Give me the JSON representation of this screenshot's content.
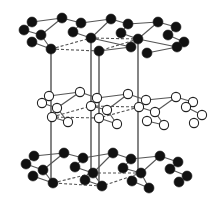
{
  "diagram": {
    "title": "",
    "type": "layered hexagonal crystal structure",
    "colors": {
      "filled_atom": "#111111",
      "open_atom": "#ffffff",
      "bond": "#555555",
      "outline": "#222222"
    },
    "unit_cell_verticals_x": [
      51,
      91,
      99,
      138
    ],
    "unit_cell_y_range": [
      49,
      186
    ],
    "layers": [
      {
        "name": "top",
        "fill": "filled",
        "rows": [
          [
            [
              32,
              22
            ],
            [
              62,
              18
            ],
            [
              81,
              23
            ],
            [
              111,
              19
            ],
            [
              128,
              24
            ],
            [
              158,
              22
            ],
            [
              176,
              27
            ]
          ],
          [
            [
              24,
              30
            ],
            [
              41,
              35
            ],
            [
              73,
              32
            ],
            [
              91,
              38
            ],
            [
              121,
              33
            ],
            [
              138,
              39
            ],
            [
              168,
              35
            ],
            [
              184,
              42
            ]
          ],
          [
            [
              32,
              42
            ],
            [
              51,
              49
            ],
            [
              99,
              51
            ],
            [
              131,
              47
            ],
            [
              147,
              53
            ],
            [
              177,
              47
            ]
          ]
        ],
        "dashed": [
          [
            51,
            49
          ],
          [
            91,
            38
          ],
          [
            138,
            39
          ],
          [
            99,
            51
          ]
        ]
      },
      {
        "name": "middle",
        "fill": "open",
        "rows": [
          [
            [
              49,
              96
            ],
            [
              80,
              92
            ],
            [
              97,
              98
            ],
            [
              128,
              94
            ],
            [
              146,
              100
            ],
            [
              176,
              97
            ],
            [
              193,
              102
            ]
          ],
          [
            [
              42,
              103
            ],
            [
              57,
              108
            ],
            [
              91,
              106
            ],
            [
              107,
              110
            ],
            [
              139,
              107
            ],
            [
              155,
              112
            ],
            [
              186,
              107
            ],
            [
              202,
              115
            ]
          ],
          [
            [
              52,
              117
            ],
            [
              68,
              122
            ],
            [
              99,
              118
            ],
            [
              117,
              124
            ],
            [
              147,
              121
            ],
            [
              164,
              125
            ],
            [
              194,
              123
            ]
          ]
        ],
        "dashed": [
          [
            52,
            117
          ],
          [
            91,
            106
          ],
          [
            139,
            107
          ],
          [
            99,
            118
          ]
        ]
      },
      {
        "name": "bottom",
        "fill": "filled",
        "rows": [
          [
            [
              34,
              156
            ],
            [
              64,
              153
            ],
            [
              83,
              158
            ],
            [
              113,
              153
            ],
            [
              131,
              159
            ],
            [
              160,
              156
            ],
            [
              178,
              162
            ]
          ],
          [
            [
              26,
              164
            ],
            [
              43,
              170
            ],
            [
              75,
              167
            ],
            [
              93,
              173
            ],
            [
              123,
              168
            ],
            [
              141,
              173
            ],
            [
              170,
              169
            ],
            [
              187,
              176
            ]
          ],
          [
            [
              33,
              176
            ],
            [
              53,
              183
            ],
            [
              85,
              180
            ],
            [
              102,
              186
            ],
            [
              132,
              181
            ],
            [
              149,
              188
            ],
            [
              179,
              182
            ]
          ]
        ],
        "dashed": [
          [
            53,
            183
          ],
          [
            93,
            173
          ],
          [
            141,
            173
          ],
          [
            102,
            186
          ]
        ]
      }
    ]
  }
}
